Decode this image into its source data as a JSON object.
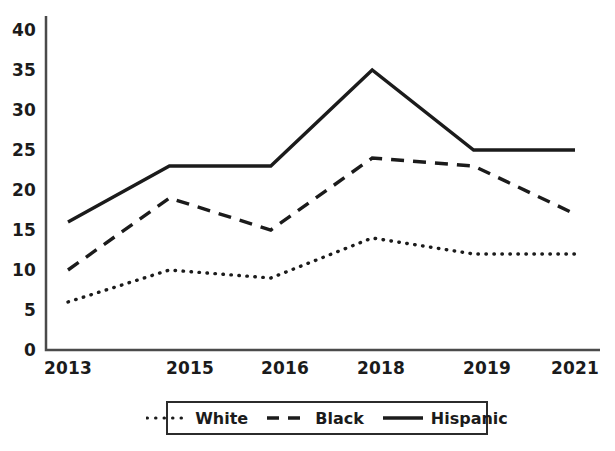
{
  "chart_data": {
    "type": "line",
    "title": "",
    "xlabel": "",
    "ylabel": "",
    "categories": [
      "2013",
      "2015",
      "2016",
      "2018",
      "2019",
      "2021"
    ],
    "ylim": [
      0,
      40
    ],
    "ytick_labels": [
      "0",
      "5",
      "10",
      "15",
      "20",
      "25",
      "30",
      "35",
      "40"
    ],
    "ytick_values": [
      0,
      5,
      10,
      15,
      20,
      25,
      30,
      35,
      40
    ],
    "grid": false,
    "legend_position": "below-center",
    "series": [
      {
        "name": "White",
        "line_style": "dotted",
        "color": "#1b1b1b",
        "values": [
          6,
          10,
          9,
          14,
          12,
          12
        ]
      },
      {
        "name": "Black",
        "line_style": "dashed",
        "color": "#1b1b1b",
        "values": [
          10,
          19,
          15,
          24,
          23,
          17
        ]
      },
      {
        "name": "Hispanic",
        "line_style": "solid",
        "color": "#1b1b1b",
        "values": [
          16,
          23,
          23,
          35,
          25,
          25
        ]
      }
    ]
  },
  "legend": {
    "items": [
      {
        "label": "White",
        "style": "dotted"
      },
      {
        "label": "Black",
        "style": "dashed"
      },
      {
        "label": "Hispanic",
        "style": "solid"
      }
    ]
  },
  "axes": {
    "y_labels": [
      "40",
      "35",
      "30",
      "25",
      "20",
      "15",
      "10",
      "5",
      "0"
    ],
    "x_labels": [
      "2013",
      "2015",
      "2016",
      "2018",
      "2019",
      "2021"
    ]
  },
  "colors": {
    "line": "#1b1b1b",
    "axis": "#4a4a4a",
    "background": "#ffffff"
  }
}
